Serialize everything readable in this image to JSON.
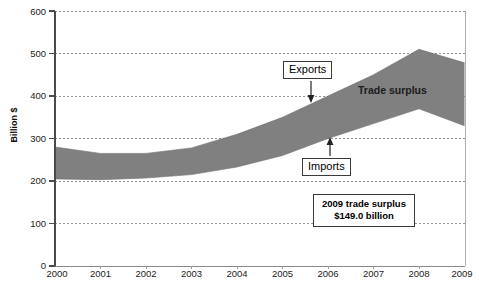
{
  "chart_data": {
    "type": "area",
    "title": "",
    "xlabel": "",
    "ylabel": "Billion $",
    "ylim": [
      0,
      600
    ],
    "xlim": [
      "2000",
      "2009"
    ],
    "grid": true,
    "legend": "none",
    "categories": [
      "2000",
      "2001",
      "2002",
      "2003",
      "2004",
      "2005",
      "2006",
      "2007",
      "2008",
      "2009"
    ],
    "series": [
      {
        "name": "Exports",
        "values": [
          280,
          265,
          265,
          278,
          310,
          350,
          400,
          450,
          510,
          478
        ]
      },
      {
        "name": "Imports",
        "values": [
          205,
          203,
          207,
          215,
          233,
          260,
          300,
          335,
          370,
          330
        ]
      }
    ],
    "band_fill_color": "#808080",
    "band_label": "Trade surplus",
    "ytick_labels": [
      "0",
      "100",
      "200",
      "300",
      "400",
      "500",
      "600"
    ],
    "ytick_values": [
      0,
      100,
      200,
      300,
      400,
      500,
      600
    ],
    "xtick_labels": [
      "2000",
      "2001",
      "2002",
      "2003",
      "2004",
      "2005",
      "2006",
      "2007",
      "2008",
      "2009"
    ],
    "annotations": [
      {
        "name": "exports-callout",
        "text": "Exports",
        "arrow": "down",
        "points_to_series": "Exports",
        "points_to_x": "2006"
      },
      {
        "name": "imports-callout",
        "text": "Imports",
        "arrow": "up",
        "points_to_series": "Imports",
        "points_to_x": "2006"
      },
      {
        "name": "surplus-callout",
        "line1": "2009 trade surplus",
        "line2": "$149.0 billion"
      },
      {
        "name": "band-inline-label",
        "text": "Trade surplus"
      }
    ]
  },
  "axis": {
    "y_title": "Billion $"
  },
  "annotations": {
    "exports_label": "Exports",
    "imports_label": "Imports",
    "trade_surplus_label": "Trade surplus",
    "surplus_line1": "2009 trade surplus",
    "surplus_line2": "$149.0 billion"
  },
  "colors": {
    "band": "#808080",
    "axis": "#555555",
    "grid": "#9a9a9a",
    "text": "#1a1a1a"
  },
  "caption_sliver": ""
}
